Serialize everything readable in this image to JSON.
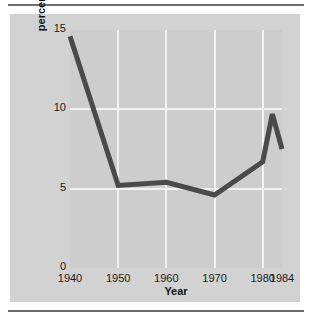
{
  "chart_data": {
    "type": "line",
    "title": "",
    "xlabel": "Year",
    "ylabel_line1": "Unemployment as",
    "ylabel_line2": "percentage of civilian labor force",
    "ylabel": "Unemployment as percentage of civilian labor force",
    "x": [
      1940,
      1950,
      1960,
      1970,
      1980,
      1982,
      1984
    ],
    "values": [
      14.6,
      5.2,
      5.4,
      4.6,
      6.7,
      9.7,
      7.5
    ],
    "series": [
      {
        "name": "Unemployment rate",
        "values": [
          14.6,
          5.2,
          5.4,
          4.6,
          6.7,
          9.7,
          7.5
        ]
      }
    ],
    "xticks": [
      "1940",
      "1950",
      "1960",
      "1970",
      "1980",
      "1984"
    ],
    "xtick_values": [
      1940,
      1950,
      1960,
      1970,
      1980,
      1984
    ],
    "yticks": [
      "0",
      "5",
      "10",
      "15"
    ],
    "ytick_values": [
      0,
      5,
      10,
      15
    ],
    "xlim": [
      1940,
      1984
    ],
    "ylim": [
      0,
      15
    ],
    "grid": "white gridlines at y=5, y=10 and x=1950, 1960, 1970, 1980",
    "legend": "none",
    "line_color": "#4a4a4a",
    "plot_background": "#cdcdcd",
    "panel_background": "#d2d2d2",
    "gridline_color": "#f2f2f2"
  }
}
